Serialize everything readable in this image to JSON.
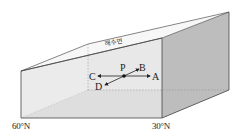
{
  "diagram": {
    "title": "",
    "sea_surface_label": "해수면",
    "point_center": "P",
    "arrows": [
      {
        "label": "A",
        "direction": "east (right)"
      },
      {
        "label": "B",
        "direction": "northeast-ish / back-right"
      },
      {
        "label": "C",
        "direction": "west (left)"
      },
      {
        "label": "D",
        "direction": "southwest-ish / front-left"
      }
    ],
    "latitude_labels": {
      "left": "60°N",
      "right": "30°N"
    },
    "colors": {
      "right_face": "#bdbdbd",
      "floor": "#d9d9d9",
      "front_face": "#efefef",
      "edge": "#444444"
    }
  }
}
